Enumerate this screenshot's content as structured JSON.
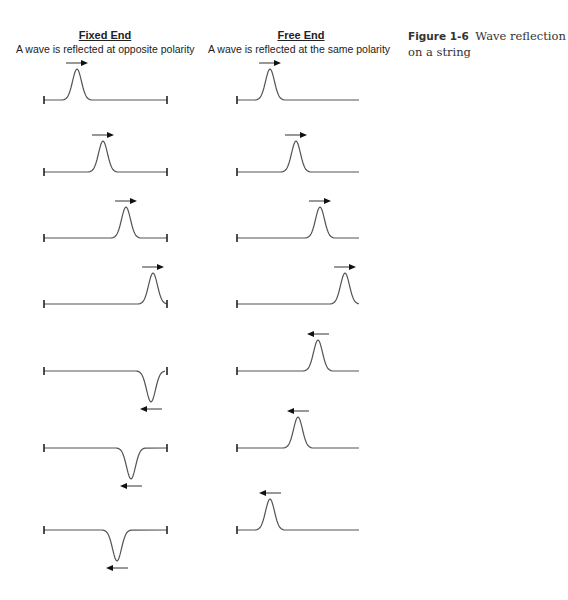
{
  "columns": [
    {
      "title": "Fixed End",
      "subtitle": "A wave is reflected at opposite polarity",
      "left_x": 44,
      "right_x": 167,
      "right_tick": true,
      "rows": [
        {
          "baseline": 100,
          "peak_x": 77,
          "dir": "right",
          "polarity": "up",
          "clip_right": false
        },
        {
          "baseline": 172,
          "peak_x": 103,
          "dir": "right",
          "polarity": "up",
          "clip_right": false
        },
        {
          "baseline": 238,
          "peak_x": 126,
          "dir": "right",
          "polarity": "up",
          "clip_right": false
        },
        {
          "baseline": 304,
          "peak_x": 153,
          "dir": "right",
          "polarity": "up",
          "clip_right": true
        },
        {
          "baseline": 371,
          "peak_x": 151,
          "dir": "left",
          "polarity": "down",
          "clip_right": true
        },
        {
          "baseline": 448,
          "peak_x": 131,
          "dir": "left",
          "polarity": "down",
          "clip_right": false
        },
        {
          "baseline": 530,
          "peak_x": 117,
          "dir": "left",
          "polarity": "down",
          "clip_right": false
        }
      ]
    },
    {
      "title": "Free End",
      "subtitle": "A wave is reflected at the same polarity",
      "left_x": 237,
      "right_x": 359,
      "right_tick": false,
      "rows": [
        {
          "baseline": 100,
          "peak_x": 270,
          "dir": "right",
          "polarity": "up",
          "clip_right": false
        },
        {
          "baseline": 172,
          "peak_x": 296,
          "dir": "right",
          "polarity": "up",
          "clip_right": false
        },
        {
          "baseline": 238,
          "peak_x": 320,
          "dir": "right",
          "polarity": "up",
          "clip_right": false
        },
        {
          "baseline": 304,
          "peak_x": 345,
          "dir": "right",
          "polarity": "up",
          "clip_right": true
        },
        {
          "baseline": 371,
          "peak_x": 318,
          "dir": "left",
          "polarity": "up",
          "clip_right": false
        },
        {
          "baseline": 448,
          "peak_x": 298,
          "dir": "left",
          "polarity": "up",
          "clip_right": false
        },
        {
          "baseline": 530,
          "peak_x": 270,
          "dir": "left",
          "polarity": "up",
          "clip_right": false
        }
      ]
    }
  ],
  "caption": {
    "figure_label": "Figure 1-6",
    "text": "Wave reflection on a string"
  },
  "style": {
    "line_color": "#555555",
    "arrow_color": "#111111",
    "pulse_height": 31,
    "pulse_half_width": 14
  }
}
